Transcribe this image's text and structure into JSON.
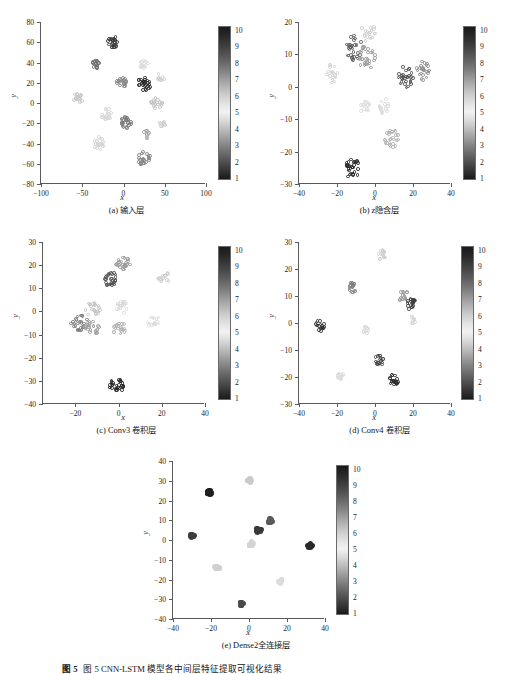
{
  "figure": {
    "caption_label": "图 5",
    "caption_text": "各层模型输出特征分布情况",
    "caption_full": "图 5  CNN-LSTM 模型各中间层特征提取可视化结果"
  },
  "colorbar": {
    "ticks": [
      "10",
      "9",
      "8",
      "7",
      "6",
      "5",
      "4",
      "3",
      "2",
      "1"
    ],
    "min": 1,
    "max": 10
  },
  "panels": [
    {
      "id": "a",
      "caption": "(a) 输入层",
      "xlabel": "x",
      "ylabel": "y",
      "xticks": [
        "-100",
        "-50",
        "0",
        "50",
        "100"
      ],
      "yticks": [
        "80",
        "60",
        "40",
        "20",
        "0",
        "-20",
        "-40",
        "-60",
        "-80"
      ],
      "xlim": [
        -100,
        100
      ],
      "ylim": [
        -80,
        80
      ]
    },
    {
      "id": "b",
      "caption": "(b) z隐含层",
      "xlabel": "x",
      "ylabel": "y",
      "xticks": [
        "-40",
        "-20",
        "0",
        "20",
        "40"
      ],
      "yticks": [
        "20",
        "10",
        "0",
        "-10",
        "-20",
        "-30"
      ],
      "xlim": [
        -40,
        40
      ],
      "ylim": [
        -30,
        20
      ]
    },
    {
      "id": "c",
      "caption": "(c) Conv3 卷积层",
      "xlabel": "x",
      "ylabel": "y",
      "xticks": [
        "-20",
        "0",
        "20",
        "40"
      ],
      "yticks": [
        "30",
        "20",
        "10",
        "0",
        "-10",
        "-20",
        "-30",
        "-40"
      ],
      "xlim": [
        -35,
        40
      ],
      "ylim": [
        -40,
        30
      ]
    },
    {
      "id": "d",
      "caption": "(d) Conv4 卷积层",
      "xlabel": "x",
      "ylabel": "y",
      "xticks": [
        "-40",
        "-20",
        "0",
        "20",
        "40"
      ],
      "yticks": [
        "30",
        "20",
        "10",
        "0",
        "-10",
        "-20",
        "-30"
      ],
      "xlim": [
        -40,
        40
      ],
      "ylim": [
        -30,
        30
      ]
    },
    {
      "id": "e",
      "caption": "(e) Dense2全连接层",
      "xlabel": "x",
      "ylabel": "y",
      "xticks": [
        "-40",
        "-20",
        "0",
        "20",
        "40"
      ],
      "yticks": [
        "40",
        "30",
        "20",
        "10",
        "0",
        "-10",
        "-20",
        "-30",
        "-40"
      ],
      "xlim": [
        -40,
        40
      ],
      "ylim": [
        -40,
        40
      ]
    }
  ],
  "chart_data": [
    {
      "type": "scatter",
      "panel": "a",
      "title": "(a) 输入层",
      "xlabel": "x",
      "ylabel": "y",
      "xlim": [
        -100,
        100
      ],
      "ylim": [
        -80,
        80
      ],
      "grid": false,
      "colorbar": {
        "label": "",
        "range": [
          1,
          10
        ]
      },
      "clusters": [
        {
          "class": 10,
          "cx": -12,
          "cy": 60,
          "n": 22,
          "spread": 7,
          "tone": "#3a3a3a"
        },
        {
          "class": 9,
          "cx": -34,
          "cy": 38,
          "n": 16,
          "spread": 5,
          "tone": "#6d6d6d"
        },
        {
          "class": 8,
          "cx": -3,
          "cy": 21,
          "n": 22,
          "spread": 7,
          "tone": "#8a8a8a"
        },
        {
          "class": 1,
          "cx": 25,
          "cy": 19,
          "n": 26,
          "spread": 8,
          "tone": "#2c2c2c"
        },
        {
          "class": 6,
          "cx": -55,
          "cy": 5,
          "n": 16,
          "spread": 6,
          "tone": "#c9c9c9"
        },
        {
          "class": 5,
          "cx": -20,
          "cy": -11,
          "n": 18,
          "spread": 7,
          "tone": "#d8d8d8"
        },
        {
          "class": 4,
          "cx": 25,
          "cy": 38,
          "n": 14,
          "spread": 6,
          "tone": "#dedede"
        },
        {
          "class": 5,
          "cx": 45,
          "cy": 25,
          "n": 10,
          "spread": 5,
          "tone": "#d2d2d2"
        },
        {
          "class": 3,
          "cx": 3,
          "cy": -19,
          "n": 24,
          "spread": 7,
          "tone": "#7a7a7a"
        },
        {
          "class": 6,
          "cx": 40,
          "cy": 0,
          "n": 18,
          "spread": 7,
          "tone": "#c4c4c4"
        },
        {
          "class": 7,
          "cx": -30,
          "cy": -40,
          "n": 20,
          "spread": 8,
          "tone": "#d6d6d6"
        },
        {
          "class": 2,
          "cx": 25,
          "cy": -55,
          "n": 26,
          "spread": 8,
          "tone": "#888888"
        },
        {
          "class": 4,
          "cx": 27,
          "cy": -31,
          "n": 10,
          "spread": 5,
          "tone": "#a8a8a8"
        },
        {
          "class": 6,
          "cx": 47,
          "cy": -21,
          "n": 8,
          "spread": 4,
          "tone": "#cfcfcf"
        }
      ]
    },
    {
      "type": "scatter",
      "panel": "b",
      "title": "(b) z隐含层",
      "xlabel": "x",
      "ylabel": "y",
      "xlim": [
        -40,
        40
      ],
      "ylim": [
        -30,
        20
      ],
      "grid": false,
      "colorbar": {
        "label": "",
        "range": [
          1,
          10
        ]
      },
      "clusters": [
        {
          "class": 9,
          "cx": -11,
          "cy": 12,
          "n": 30,
          "spread": 4.5,
          "tone": "#5b5b5b"
        },
        {
          "class": 7,
          "cx": -4,
          "cy": 17,
          "n": 20,
          "spread": 4,
          "tone": "#cfcfcf"
        },
        {
          "class": 8,
          "cx": -4,
          "cy": 9,
          "n": 30,
          "spread": 4.5,
          "tone": "#9a9a9a"
        },
        {
          "class": 6,
          "cx": -23,
          "cy": 4,
          "n": 18,
          "spread": 3.5,
          "tone": "#d4d4d4"
        },
        {
          "class": 2,
          "cx": 16,
          "cy": 3,
          "n": 28,
          "spread": 4,
          "tone": "#4a4a4a"
        },
        {
          "class": 3,
          "cx": 25,
          "cy": 5,
          "n": 24,
          "spread": 3.5,
          "tone": "#8e8e8e"
        },
        {
          "class": 5,
          "cx": -5,
          "cy": -6,
          "n": 20,
          "spread": 3,
          "tone": "#e0e0e0"
        },
        {
          "class": 5,
          "cx": 5,
          "cy": -6,
          "n": 18,
          "spread": 3,
          "tone": "#dcdcdc"
        },
        {
          "class": 4,
          "cx": 9,
          "cy": -16,
          "n": 26,
          "spread": 4,
          "tone": "#b0b0b0"
        },
        {
          "class": 1,
          "cx": -12,
          "cy": -25,
          "n": 28,
          "spread": 4,
          "tone": "#252525"
        }
      ]
    },
    {
      "type": "scatter",
      "panel": "c",
      "title": "(c) Conv3 卷积层",
      "xlabel": "x",
      "ylabel": "y",
      "xlim": [
        -35,
        40
      ],
      "ylim": [
        -40,
        30
      ],
      "grid": false,
      "colorbar": {
        "label": "",
        "range": [
          1,
          10
        ]
      },
      "clusters": [
        {
          "class": 8,
          "cx": 2,
          "cy": 21,
          "n": 26,
          "spread": 3.5,
          "tone": "#9b9b9b"
        },
        {
          "class": 9,
          "cx": -4,
          "cy": 14,
          "n": 28,
          "spread": 3.5,
          "tone": "#4f4f4f"
        },
        {
          "class": 5,
          "cx": 21,
          "cy": 15,
          "n": 18,
          "spread": 3,
          "tone": "#d0d0d0"
        },
        {
          "class": 6,
          "cx": -12,
          "cy": 1,
          "n": 22,
          "spread": 3.5,
          "tone": "#c6c6c6"
        },
        {
          "class": 7,
          "cx": 2,
          "cy": 2,
          "n": 20,
          "spread": 3,
          "tone": "#dadada"
        },
        {
          "class": 4,
          "cx": 16,
          "cy": -4,
          "n": 16,
          "spread": 3,
          "tone": "#dcdcdc"
        },
        {
          "class": 10,
          "cx": -18,
          "cy": -5,
          "n": 26,
          "spread": 4,
          "tone": "#7a7a7a"
        },
        {
          "class": 9,
          "cx": -12,
          "cy": -7,
          "n": 24,
          "spread": 3.5,
          "tone": "#a0a0a0"
        },
        {
          "class": 3,
          "cx": 1,
          "cy": -8,
          "n": 24,
          "spread": 3.5,
          "tone": "#b5b5b5"
        },
        {
          "class": 1,
          "cx": -1,
          "cy": -32,
          "n": 28,
          "spread": 3.5,
          "tone": "#262626"
        }
      ]
    },
    {
      "type": "scatter",
      "panel": "d",
      "title": "(d) Conv4 卷积层",
      "xlabel": "x",
      "ylabel": "y",
      "xlim": [
        -40,
        40
      ],
      "ylim": [
        -30,
        30
      ],
      "grid": false,
      "colorbar": {
        "label": "",
        "range": [
          1,
          10
        ]
      },
      "clusters": [
        {
          "class": 6,
          "cx": 4,
          "cy": 25,
          "n": 16,
          "spread": 2.5,
          "tone": "#cfcfcf"
        },
        {
          "class": 8,
          "cx": -12,
          "cy": 13,
          "n": 18,
          "spread": 2.5,
          "tone": "#7f7f7f"
        },
        {
          "class": 7,
          "cx": 15,
          "cy": 10,
          "n": 16,
          "spread": 2.5,
          "tone": "#9a9a9a"
        },
        {
          "class": 2,
          "cx": 19,
          "cy": 7,
          "n": 20,
          "spread": 2.5,
          "tone": "#3f3f3f"
        },
        {
          "class": 10,
          "cx": -29,
          "cy": -1,
          "n": 18,
          "spread": 2.5,
          "tone": "#333333"
        },
        {
          "class": 5,
          "cx": -5,
          "cy": -3,
          "n": 12,
          "spread": 2,
          "tone": "#dadada"
        },
        {
          "class": 5,
          "cx": 20,
          "cy": 1,
          "n": 12,
          "spread": 2,
          "tone": "#d7d7d7"
        },
        {
          "class": 9,
          "cx": 2,
          "cy": -14,
          "n": 20,
          "spread": 2.5,
          "tone": "#4c4c4c"
        },
        {
          "class": 4,
          "cx": -18,
          "cy": -20,
          "n": 12,
          "spread": 2,
          "tone": "#dcdcdc"
        },
        {
          "class": 1,
          "cx": 10,
          "cy": -21,
          "n": 20,
          "spread": 2.5,
          "tone": "#2b2b2b"
        }
      ]
    },
    {
      "type": "scatter",
      "panel": "e",
      "title": "(e) Dense2全连接层",
      "xlabel": "x",
      "ylabel": "y",
      "xlim": [
        -40,
        40
      ],
      "ylim": [
        -40,
        40
      ],
      "grid": false,
      "colorbar": {
        "label": "",
        "range": [
          1,
          10
        ]
      },
      "clusters": [
        {
          "class": 6,
          "cx": 0,
          "cy": 30,
          "n": 10,
          "spread": 1.4,
          "tone": "#cacaca"
        },
        {
          "class": 10,
          "cx": -21,
          "cy": 24,
          "n": 14,
          "spread": 1.4,
          "tone": "#202020"
        },
        {
          "class": 7,
          "cx": 11,
          "cy": 10,
          "n": 12,
          "spread": 1.4,
          "tone": "#5a5a5a"
        },
        {
          "class": 8,
          "cx": 5,
          "cy": 5,
          "n": 14,
          "spread": 1.4,
          "tone": "#3a3a3a"
        },
        {
          "class": 9,
          "cx": -30,
          "cy": 2,
          "n": 10,
          "spread": 1.2,
          "tone": "#3d3d3d"
        },
        {
          "class": 5,
          "cx": 1,
          "cy": -2,
          "n": 10,
          "spread": 1.2,
          "tone": "#d4d4d4"
        },
        {
          "class": 2,
          "cx": 32,
          "cy": -3,
          "n": 12,
          "spread": 1.3,
          "tone": "#2a2a2a"
        },
        {
          "class": 4,
          "cx": -17,
          "cy": -14,
          "n": 10,
          "spread": 1.3,
          "tone": "#d0d0d0"
        },
        {
          "class": 3,
          "cx": 17,
          "cy": -21,
          "n": 10,
          "spread": 1.3,
          "tone": "#dcdcdc"
        },
        {
          "class": 1,
          "cx": -4,
          "cy": -32,
          "n": 12,
          "spread": 1.3,
          "tone": "#4a4a4a"
        }
      ]
    }
  ]
}
